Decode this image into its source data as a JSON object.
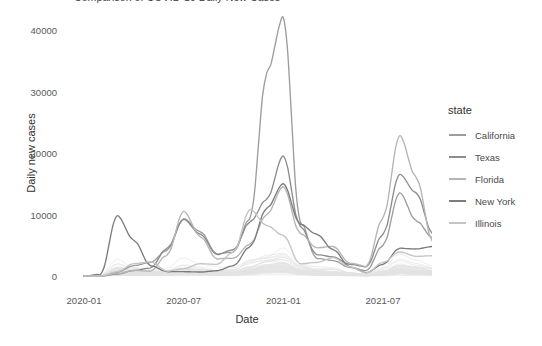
{
  "chart_data": {
    "type": "line",
    "title": "Comparison of COVID-19 Daily New Cases",
    "xlabel": "Date",
    "ylabel": "Daily new cases",
    "xlim": [
      "2020-01-01",
      "2021-10-15"
    ],
    "ylim": [
      0,
      43500
    ],
    "grid": false,
    "legend_position": "right",
    "legend_title": "state",
    "x_ticks": [
      "2020-01",
      "2020-07",
      "2021-01",
      "2021-07"
    ],
    "y_ticks": [
      "0",
      "10000",
      "20000",
      "30000",
      "40000"
    ],
    "y_tick_values": [
      0,
      10000,
      20000,
      30000,
      40000
    ],
    "x_tick_values": [
      "2020-01-01",
      "2020-07-01",
      "2021-01-01",
      "2021-07-01"
    ],
    "x_months": [
      "2020-01",
      "2020-02",
      "2020-03",
      "2020-04",
      "2020-05",
      "2020-06",
      "2020-07",
      "2020-08",
      "2020-09",
      "2020-10",
      "2020-11",
      "2020-12",
      "2021-01",
      "2021-02",
      "2021-03",
      "2021-04",
      "2021-05",
      "2021-06",
      "2021-07",
      "2021-08",
      "2021-09",
      "2021-10"
    ],
    "series": [
      {
        "name": "California",
        "color": "#9d9d9d",
        "values": [
          0,
          0,
          600,
          1700,
          2200,
          4200,
          9300,
          7200,
          3600,
          3900,
          9500,
          33000,
          42000,
          9000,
          2900,
          2500,
          1400,
          900,
          5000,
          13500,
          9000,
          6200
        ]
      },
      {
        "name": "Texas",
        "color": "#8c8c8c",
        "values": [
          0,
          0,
          300,
          900,
          1300,
          4500,
          9200,
          6800,
          3500,
          4300,
          8800,
          12500,
          19500,
          8200,
          3500,
          3100,
          1900,
          1500,
          6800,
          16500,
          13500,
          6800
        ]
      },
      {
        "name": "Florida",
        "color": "#b5b5b5",
        "values": [
          0,
          0,
          400,
          900,
          800,
          3400,
          10500,
          6400,
          2800,
          2900,
          5200,
          10000,
          14500,
          7000,
          4600,
          4800,
          2100,
          1600,
          9500,
          22800,
          16000,
          5500
        ]
      },
      {
        "name": "New York",
        "color": "#7c7c7c",
        "values": [
          0,
          300,
          9800,
          5800,
          1700,
          700,
          700,
          650,
          850,
          1700,
          4800,
          11000,
          15000,
          8500,
          6800,
          4300,
          1500,
          550,
          1900,
          4500,
          4400,
          4800
        ]
      },
      {
        "name": "Illinois",
        "color": "#c4c4c4",
        "values": [
          0,
          0,
          700,
          2000,
          2300,
          800,
          1200,
          2000,
          1900,
          3900,
          10800,
          8200,
          6600,
          2000,
          2200,
          3000,
          1500,
          500,
          2200,
          3900,
          3200,
          3300
        ]
      }
    ],
    "background_series_count": 45,
    "annotations": [
      {
        "label": "California winter peak",
        "x": "2021-01",
        "y": 42000
      },
      {
        "label": "New York spring 2020 peak",
        "x": "2020-03",
        "y": 9800
      },
      {
        "label": "Florida delta peak",
        "x": "2021-08",
        "y": 22800
      },
      {
        "label": "Florida summer 2020 peak",
        "x": "2020-07",
        "y": 10500
      }
    ]
  },
  "legend": {
    "title": "state",
    "items": [
      {
        "label": "California",
        "color": "#9d9d9d"
      },
      {
        "label": "Texas",
        "color": "#8c8c8c"
      },
      {
        "label": "Florida",
        "color": "#b5b5b5"
      },
      {
        "label": "New York",
        "color": "#7c7c7c"
      },
      {
        "label": "Illinois",
        "color": "#c4c4c4"
      }
    ]
  },
  "style": {
    "panel_background": "#ffffff",
    "background_line_color": "#e2e2e2",
    "axis_text_color": "#585858",
    "axis_title_color": "#2f2f2f"
  }
}
